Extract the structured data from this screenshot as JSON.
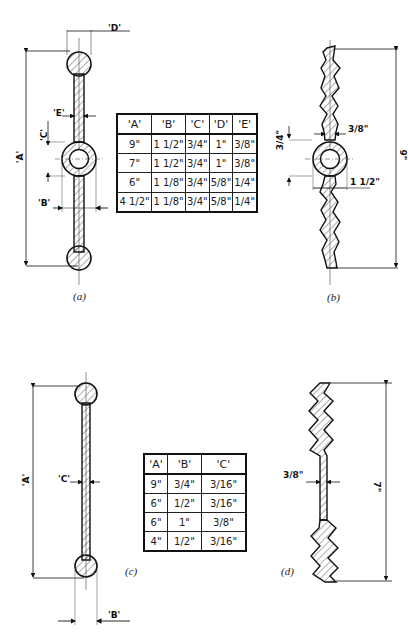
{
  "figures": {
    "a": {
      "caption": "(a)",
      "labels": {
        "A": "'A'",
        "B": "'B'",
        "C": "'C'",
        "D": "'D'",
        "E": "'E'"
      }
    },
    "b": {
      "caption": "(b)",
      "labels": {
        "height": "9\"",
        "flange": "3/8\"",
        "offset_top": "3/4\"",
        "offset_bottom": "1 1/2\""
      }
    },
    "c": {
      "caption": "(c)",
      "labels": {
        "A": "'A'",
        "B": "'B'",
        "C": "'C'"
      }
    },
    "d": {
      "caption": "(d)",
      "labels": {
        "height": "7\"",
        "flange": "3/8\""
      }
    }
  },
  "table1": {
    "headers": [
      "'A'",
      "'B'",
      "'C'",
      "'D'",
      "'E'"
    ],
    "rows": [
      [
        "9\"",
        "1 1/2\"",
        "3/4\"",
        "1\"",
        "3/8\""
      ],
      [
        "7\"",
        "1 1/2\"",
        "3/4\"",
        "1\"",
        "3/8\""
      ],
      [
        "6\"",
        "1 1/8\"",
        "3/4\"",
        "5/8\"",
        "1/4\""
      ],
      [
        "4 1/2\"",
        "1 1/8\"",
        "3/4\"",
        "5/8\"",
        "1/4\""
      ]
    ]
  },
  "table2": {
    "headers": [
      "'A'",
      "'B'",
      "'C'"
    ],
    "rows": [
      [
        "9\"",
        "3/4\"",
        "3/16\""
      ],
      [
        "6\"",
        "1/2\"",
        "3/16\""
      ],
      [
        "6\"",
        "1\"",
        "3/8\""
      ],
      [
        "4\"",
        "1/2\"",
        "3/16\""
      ]
    ]
  },
  "colors": {
    "ink": "#1a1a1a",
    "paper": "#ffffff"
  }
}
